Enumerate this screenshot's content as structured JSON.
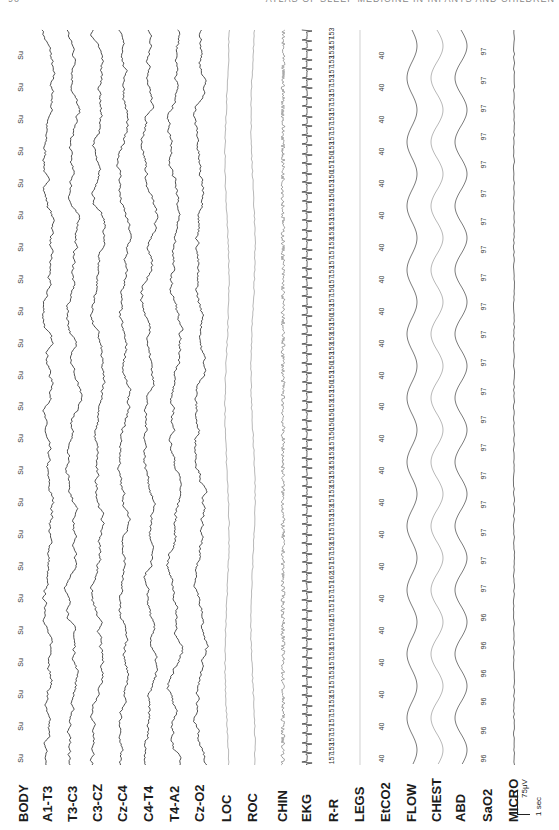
{
  "page": {
    "number": "90",
    "running_head": "ATLAS OF SLEEP MEDICINE IN INFANTS AND CHILDREN"
  },
  "figure": {
    "orientation": "rotated-90",
    "channels": [
      {
        "label": "BODY",
        "x": 24,
        "type": "annotation"
      },
      {
        "label": "A1-T3",
        "x": 48,
        "type": "eeg"
      },
      {
        "label": "T3-C3",
        "x": 73,
        "type": "eeg"
      },
      {
        "label": "C3-CZ",
        "x": 98,
        "type": "eeg"
      },
      {
        "label": "Cz-C4",
        "x": 123,
        "type": "eeg"
      },
      {
        "label": "C4-T4",
        "x": 149,
        "type": "eeg"
      },
      {
        "label": "T4-A2",
        "x": 175,
        "type": "eeg"
      },
      {
        "label": "Cz-O2",
        "x": 200,
        "type": "eeg"
      },
      {
        "label": "LOC",
        "x": 227,
        "type": "eog"
      },
      {
        "label": "ROC",
        "x": 253,
        "type": "eog"
      },
      {
        "label": "CHIN",
        "x": 283,
        "type": "emg"
      },
      {
        "label": "EKG",
        "x": 307,
        "type": "ekg"
      },
      {
        "label": "R-R",
        "x": 334,
        "type": "annotation"
      },
      {
        "label": "LEGS",
        "x": 360,
        "type": "flat"
      },
      {
        "label": "EtCO2",
        "x": 386,
        "type": "annotation"
      },
      {
        "label": "FLOW",
        "x": 412,
        "type": "resp"
      },
      {
        "label": "CHEST",
        "x": 437,
        "type": "resp"
      },
      {
        "label": "ABD",
        "x": 461,
        "type": "resp"
      },
      {
        "label": "SaO2",
        "x": 488,
        "type": "annotation"
      },
      {
        "label": "MICRO",
        "x": 514,
        "type": "flat"
      }
    ],
    "body_position": [
      "Su",
      "Su",
      "Su",
      "Su",
      "Su",
      "Su",
      "Su",
      "Su",
      "Su",
      "Su",
      "Su",
      "Su",
      "Su",
      "Su",
      "Su",
      "Su",
      "Su",
      "Su",
      "Su",
      "Su",
      "Su",
      "Su",
      "Su"
    ],
    "rr_intervals": [
      "157",
      "153",
      "157",
      "157",
      "157",
      "157",
      "153",
      "157",
      "157",
      "153",
      "157",
      "153",
      "157",
      "157",
      "162",
      "157",
      "157",
      "157",
      "157",
      "162",
      "157",
      "157",
      "153",
      "157",
      "157",
      "153",
      "153",
      "157",
      "153",
      "153",
      "153",
      "153",
      "153",
      "157",
      "150",
      "150",
      "150",
      "153",
      "153",
      "150",
      "153",
      "150",
      "153",
      "153",
      "153",
      "153",
      "150",
      "153",
      "157",
      "150",
      "157",
      "153",
      "157",
      "157",
      "153",
      "153",
      "153",
      "153",
      "153",
      "150",
      "153",
      "150",
      "157",
      "150",
      "153",
      "157",
      "157",
      "153",
      "157",
      "153",
      "157",
      "153",
      "157",
      "153",
      "153",
      "157",
      "153"
    ],
    "etco2_values": [
      "40",
      "40",
      "40",
      "40",
      "40",
      "40",
      "40",
      "40",
      "40",
      "40",
      "40",
      "40",
      "40",
      "40",
      "40",
      "40",
      "40",
      "40",
      "40",
      "40",
      "40",
      "40",
      "40"
    ],
    "sao2_values": [
      "96",
      "96",
      "96",
      "96",
      "96",
      "96",
      "97",
      "97",
      "97",
      "97",
      "97",
      "97",
      "97",
      "97",
      "97",
      "97",
      "97",
      "97",
      "97",
      "97",
      "97",
      "97",
      "97",
      "97",
      "97",
      "97"
    ],
    "scale_bar": {
      "amplitude": "75μV",
      "time": "1 sec"
    }
  }
}
